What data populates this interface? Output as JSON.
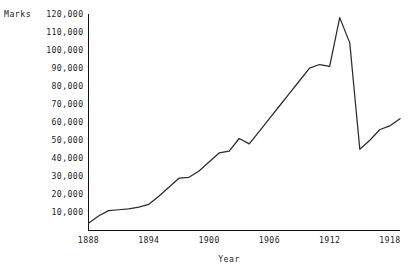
{
  "chart_data": {
    "type": "line",
    "title": "",
    "subtitle": "",
    "xlabel": "Year",
    "ylabel": "Marks",
    "xlim": [
      1888,
      1919
    ],
    "ylim": [
      0,
      120000
    ],
    "grid": false,
    "legend": false,
    "legend_position": "none",
    "xticks": [
      1888,
      1894,
      1900,
      1906,
      1912,
      1918
    ],
    "xtick_labels": [
      "1888",
      "1894",
      "1900",
      "1906",
      "1912",
      "1918"
    ],
    "yticks": [
      10000,
      20000,
      30000,
      40000,
      50000,
      60000,
      70000,
      80000,
      90000,
      100000,
      110000,
      120000
    ],
    "ytick_labels": [
      "10,000",
      "20,000",
      "30,000",
      "40,000",
      "50,000",
      "60,000",
      "70,000",
      "80,000",
      "90,000",
      "100,000",
      "110,000",
      "120,000"
    ],
    "x": [
      1888,
      1889,
      1890,
      1891,
      1892,
      1893,
      1894,
      1895,
      1896,
      1897,
      1898,
      1899,
      1900,
      1901,
      1902,
      1903,
      1904,
      1905,
      1906,
      1907,
      1908,
      1909,
      1910,
      1911,
      1912,
      1913,
      1914,
      1915,
      1916,
      1917,
      1918,
      1919
    ],
    "values": [
      4000,
      8000,
      11000,
      11500,
      12000,
      13000,
      14500,
      19000,
      24000,
      29000,
      29500,
      33000,
      38000,
      43000,
      44000,
      51000,
      48000,
      55000,
      62000,
      69000,
      76000,
      83000,
      90000,
      92000,
      91000,
      118000,
      104000,
      45000,
      50000,
      56000,
      58000,
      62000
    ],
    "series": [
      {
        "name": "Marks",
        "values": [
          4000,
          8000,
          11000,
          11500,
          12000,
          13000,
          14500,
          19000,
          24000,
          29000,
          29500,
          33000,
          38000,
          43000,
          44000,
          51000,
          48000,
          55000,
          62000,
          69000,
          76000,
          83000,
          90000,
          92000,
          91000,
          118000,
          104000,
          45000,
          50000,
          56000,
          58000,
          62000
        ]
      }
    ],
    "annotations": [],
    "line_color": "#2b2b2b",
    "axis_color": "#111111",
    "background_color": "#ffffff"
  }
}
